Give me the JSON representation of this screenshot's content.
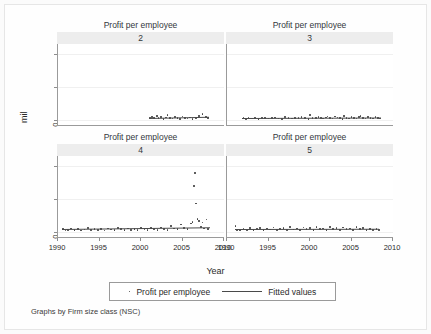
{
  "figure": {
    "ylabel": "mil",
    "xlabel": "Year",
    "caption": "Graphs by Firm size class (NSC)",
    "legend": {
      "scatter_label": "Profit per employee",
      "fit_label": "Fitted values"
    }
  },
  "chart_data": {
    "type": "scatter",
    "title": "",
    "xlabel": "Year",
    "ylabel": "mil",
    "grid": true,
    "legend_position": "bottom",
    "xlim": [
      1990,
      2010
    ],
    "ylim": [
      -150,
      2300
    ],
    "xticks": [
      1990,
      1995,
      2000,
      2005,
      2010
    ],
    "xtick_labels": [
      "1990",
      "1995",
      "2000",
      "2005",
      "2010"
    ],
    "yticks": [
      0,
      1000,
      2000
    ],
    "ytick_labels": [
      "0",
      "1000",
      "2000"
    ],
    "panel_title": "Profit per employee",
    "panel_by": "Firm size class (NSC)",
    "series_names": [
      "Profit per employee",
      "Fitted values"
    ],
    "panels": [
      {
        "id": "2",
        "label": "2",
        "row": 0,
        "col": 0,
        "points": [
          [
            2001.1,
            70
          ],
          [
            2001.3,
            95
          ],
          [
            2001.6,
            55
          ],
          [
            2001.9,
            120
          ],
          [
            2002.1,
            60
          ],
          [
            2002.4,
            85
          ],
          [
            2002.7,
            40
          ],
          [
            2003.0,
            75
          ],
          [
            2003.2,
            150
          ],
          [
            2003.5,
            65
          ],
          [
            2003.8,
            50
          ],
          [
            2004.1,
            95
          ],
          [
            2004.4,
            70
          ],
          [
            2004.7,
            30
          ],
          [
            2005.0,
            110
          ],
          [
            2005.3,
            60
          ],
          [
            2005.6,
            45
          ],
          [
            2005.9,
            80
          ],
          [
            2006.2,
            35
          ],
          [
            2006.6,
            70
          ],
          [
            2007.0,
            130
          ],
          [
            2007.4,
            175
          ],
          [
            2007.8,
            95
          ],
          [
            2008.1,
            60
          ]
        ],
        "fit": {
          "x0": 2001.0,
          "y0": 68,
          "x1": 2008.2,
          "y1": 108
        }
      },
      {
        "id": "3",
        "label": "3",
        "row": 0,
        "col": 1,
        "points": [
          [
            1992.0,
            60
          ],
          [
            1992.3,
            40
          ],
          [
            1992.6,
            75
          ],
          [
            1993.0,
            50
          ],
          [
            1993.4,
            65
          ],
          [
            1993.8,
            35
          ],
          [
            1994.2,
            55
          ],
          [
            1994.6,
            70
          ],
          [
            1995.0,
            45
          ],
          [
            1995.4,
            60
          ],
          [
            1995.8,
            80
          ],
          [
            1996.2,
            50
          ],
          [
            1996.6,
            40
          ],
          [
            1997.0,
            90
          ],
          [
            1997.4,
            60
          ],
          [
            1997.8,
            45
          ],
          [
            1998.2,
            70
          ],
          [
            1998.6,
            55
          ],
          [
            1999.0,
            85
          ],
          [
            1999.4,
            60
          ],
          [
            1999.8,
            40
          ],
          [
            2000.0,
            150
          ],
          [
            2000.3,
            70
          ],
          [
            2000.7,
            55
          ],
          [
            2001.0,
            95
          ],
          [
            2001.3,
            60
          ],
          [
            2001.6,
            45
          ],
          [
            2001.9,
            75
          ],
          [
            2002.1,
            105
          ],
          [
            2002.4,
            65
          ],
          [
            2002.7,
            50
          ],
          [
            2003.0,
            110
          ],
          [
            2003.3,
            80
          ],
          [
            2003.6,
            55
          ],
          [
            2003.9,
            40
          ],
          [
            2004.1,
            120
          ],
          [
            2004.4,
            70
          ],
          [
            2004.7,
            50
          ],
          [
            2005.0,
            95
          ],
          [
            2005.3,
            65
          ],
          [
            2005.6,
            45
          ],
          [
            2005.9,
            85
          ],
          [
            2006.1,
            115
          ],
          [
            2006.4,
            70
          ],
          [
            2006.7,
            50
          ],
          [
            2007.0,
            100
          ],
          [
            2007.3,
            60
          ],
          [
            2007.6,
            45
          ],
          [
            2007.9,
            90
          ],
          [
            2008.2,
            65
          ],
          [
            2008.4,
            50
          ]
        ],
        "fit": {
          "x0": 1991.8,
          "y0": 58,
          "x1": 2008.5,
          "y1": 72
        }
      },
      {
        "id": "4",
        "label": "4",
        "row": 1,
        "col": 0,
        "points": [
          [
            1990.6,
            90
          ],
          [
            1990.9,
            50
          ],
          [
            1991.2,
            70
          ],
          [
            1991.6,
            110
          ],
          [
            1992.0,
            60
          ],
          [
            1992.4,
            95
          ],
          [
            1992.8,
            45
          ],
          [
            1993.2,
            80
          ],
          [
            1993.6,
            120
          ],
          [
            1994.0,
            55
          ],
          [
            1994.4,
            100
          ],
          [
            1994.8,
            70
          ],
          [
            1995.2,
            90
          ],
          [
            1995.6,
            50
          ],
          [
            1996.0,
            110
          ],
          [
            1996.4,
            75
          ],
          [
            1996.8,
            60
          ],
          [
            1997.2,
            130
          ],
          [
            1997.6,
            85
          ],
          [
            1998.0,
            55
          ],
          [
            1998.4,
            105
          ],
          [
            1998.8,
            70
          ],
          [
            1999.2,
            95
          ],
          [
            1999.6,
            60
          ],
          [
            2000.0,
            125
          ],
          [
            2000.4,
            80
          ],
          [
            2000.8,
            55
          ],
          [
            2001.2,
            115
          ],
          [
            2001.6,
            90
          ],
          [
            2002.0,
            65
          ],
          [
            2002.4,
            140
          ],
          [
            2002.8,
            95
          ],
          [
            2003.2,
            70
          ],
          [
            2003.6,
            180
          ],
          [
            2004.0,
            110
          ],
          [
            2004.4,
            85
          ],
          [
            2004.8,
            230
          ],
          [
            2005.2,
            120
          ],
          [
            2005.6,
            90
          ],
          [
            2006.0,
            260
          ],
          [
            2006.2,
            300
          ],
          [
            2006.4,
            1400
          ],
          [
            2006.5,
            1780
          ],
          [
            2006.6,
            860
          ],
          [
            2006.8,
            400
          ],
          [
            2007.0,
            330
          ],
          [
            2007.2,
            150
          ],
          [
            2007.4,
            290
          ],
          [
            2007.6,
            110
          ],
          [
            2007.9,
            380
          ],
          [
            2008.1,
            95
          ]
        ],
        "fit": {
          "x0": 1990.5,
          "y0": 78,
          "x1": 2008.3,
          "y1": 128
        }
      },
      {
        "id": "5",
        "label": "5",
        "row": 1,
        "col": 1,
        "points": [
          [
            1991.0,
            180
          ],
          [
            1991.2,
            70
          ],
          [
            1991.6,
            50
          ],
          [
            1992.0,
            100
          ],
          [
            1992.4,
            65
          ],
          [
            1992.8,
            120
          ],
          [
            1993.2,
            55
          ],
          [
            1993.6,
            90
          ],
          [
            1994.0,
            130
          ],
          [
            1994.4,
            60
          ],
          [
            1994.8,
            105
          ],
          [
            1995.2,
            75
          ],
          [
            1995.6,
            140
          ],
          [
            1996.0,
            65
          ],
          [
            1996.4,
            95
          ],
          [
            1996.8,
            120
          ],
          [
            1997.2,
            55
          ],
          [
            1997.6,
            150
          ],
          [
            1998.0,
            80
          ],
          [
            1998.4,
            110
          ],
          [
            1998.8,
            60
          ],
          [
            1999.2,
            135
          ],
          [
            1999.6,
            90
          ],
          [
            2000.0,
            115
          ],
          [
            2000.4,
            70
          ],
          [
            2000.8,
            145
          ],
          [
            2001.2,
            85
          ],
          [
            2001.6,
            105
          ],
          [
            2002.0,
            60
          ],
          [
            2002.4,
            160
          ],
          [
            2002.8,
            95
          ],
          [
            2003.2,
            120
          ],
          [
            2003.6,
            70
          ],
          [
            2004.0,
            140
          ],
          [
            2004.4,
            85
          ],
          [
            2004.8,
            110
          ],
          [
            2005.2,
            65
          ],
          [
            2005.6,
            155
          ],
          [
            2006.0,
            90
          ],
          [
            2006.4,
            125
          ],
          [
            2006.8,
            70
          ],
          [
            2007.2,
            100
          ],
          [
            2007.6,
            60
          ],
          [
            2008.0,
            85
          ],
          [
            2008.3,
            55
          ]
        ],
        "fit": {
          "x0": 1991.0,
          "y0": 92,
          "x1": 2008.4,
          "y1": 98
        }
      }
    ]
  }
}
